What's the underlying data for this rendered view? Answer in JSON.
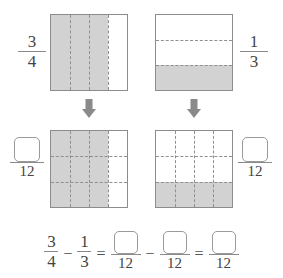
{
  "problem": {
    "left_fraction": {
      "numerator": "3",
      "denominator": "4"
    },
    "right_fraction": {
      "numerator": "1",
      "denominator": "3"
    },
    "common_denominator": "12"
  },
  "top_row": {
    "left_label": {
      "numerator": "3",
      "denominator": "4"
    },
    "right_label": {
      "numerator": "1",
      "denominator": "3"
    }
  },
  "bottom_row": {
    "left_label": {
      "numerator": "",
      "denominator": "12"
    },
    "right_label": {
      "numerator": "",
      "denominator": "12"
    }
  },
  "equation": {
    "frac1": {
      "numerator": "3",
      "denominator": "4"
    },
    "minus1": "−",
    "equals1": "=",
    "frac2": {
      "numerator": "",
      "denominator": "12"
    },
    "minus2": "−",
    "frac3": {
      "numerator": "",
      "denominator": "12"
    },
    "equals2": "=",
    "frac4": {
      "numerator": "",
      "denominator": "12"
    },
    "frac1b": {
      "numerator": "1",
      "denominator": "3"
    }
  },
  "diagrams": {
    "top_left": {
      "name": "three-fourths-model",
      "columns": 4,
      "rows": 1,
      "shaded_cells": 3,
      "total_cells": 4
    },
    "top_right": {
      "name": "one-third-model",
      "columns": 1,
      "rows": 3,
      "shaded_cells": 1,
      "total_cells": 3
    },
    "bottom_left": {
      "name": "nine-twelfths-model",
      "columns": 4,
      "rows": 3,
      "shaded_cells": 9,
      "total_cells": 12
    },
    "bottom_right": {
      "name": "four-twelfths-model",
      "columns": 4,
      "rows": 3,
      "shaded_cells": 4,
      "total_cells": 12
    }
  },
  "colors": {
    "shade": "#d2d2d2",
    "border": "#8c8c8c",
    "dash": "#8f8f8f",
    "text": "#444444",
    "arrow": "#8a8a8a"
  },
  "arrows": {
    "left": "down-arrow",
    "right": "down-arrow"
  }
}
